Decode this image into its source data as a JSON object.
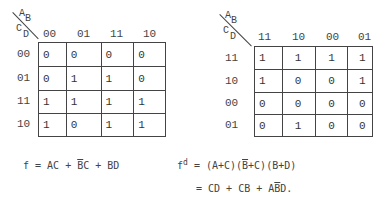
{
  "left_map": {
    "corner": {
      "row_vars_top": "A",
      "row_vars_top_sub": "B",
      "col_vars": "C",
      "col_vars_sub": "D"
    },
    "col_headers": [
      "00",
      "01",
      "11",
      "10"
    ],
    "row_headers": [
      "00",
      "01",
      "11",
      "10"
    ],
    "cells": [
      [
        "0",
        "0",
        "0",
        "0"
      ],
      [
        "0",
        "1",
        "1",
        "0"
      ],
      [
        "1",
        "1",
        "1",
        "1"
      ],
      [
        "1",
        "0",
        "1",
        "1"
      ]
    ]
  },
  "right_map": {
    "corner": {
      "row_vars_top": "A",
      "row_vars_top_sub": "B",
      "col_vars": "C",
      "col_vars_sub": "D"
    },
    "col_headers": [
      "11",
      "10",
      "00",
      "01"
    ],
    "row_headers": [
      "11",
      "10",
      "00",
      "01"
    ],
    "cells": [
      [
        "1",
        "1",
        "1",
        "1"
      ],
      [
        "1",
        "0",
        "0",
        "1"
      ],
      [
        "0",
        "0",
        "0",
        "0"
      ],
      [
        "0",
        "1",
        "0",
        "0"
      ]
    ]
  },
  "formulas": {
    "f": {
      "lhs": "f",
      "eq": " = ",
      "t1": "AC + ",
      "t2_bar": "B",
      "t2_rest": "C + BD"
    },
    "fd_line1": {
      "lhs": "f",
      "sup": "d",
      "eq": " = ",
      "p1": "(A+C)(",
      "p2_bar": "B",
      "p2_rest": "+C)(B+D)"
    },
    "fd_line2": {
      "eq": "= ",
      "t1": "CD + CB + A",
      "t2_bar": "B",
      "t2_rest": "D."
    }
  }
}
